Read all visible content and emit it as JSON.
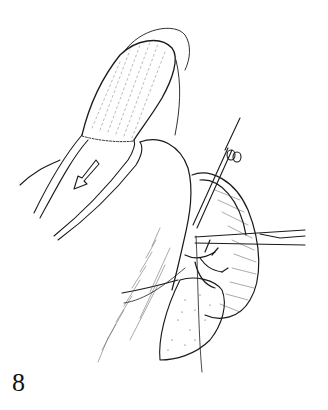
{
  "figure": {
    "number": "8",
    "type": "surgical line illustration",
    "colors": {
      "ink": "#1a1a1a",
      "background": "#ffffff"
    }
  },
  "elements": {
    "bowel_segment": "elongated tubular organ with stippled surface pointing up-right",
    "direction_arrow": "arrow-icon pointing down-left",
    "clamp_vertical": "forceps with ring handles at top right",
    "clamp_horizontal": "long instrument extending to right",
    "vessels": "branching vessels at center",
    "mass": "stippled tissue mass at lower center",
    "suture_line": "thin thread hanging down"
  }
}
